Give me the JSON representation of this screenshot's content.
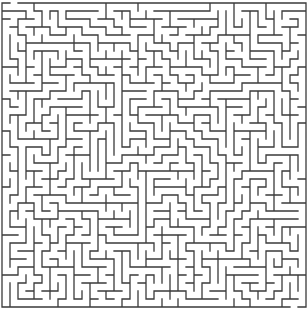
{
  "maze": {
    "width_px": 308,
    "height_px": 310,
    "cols": 38,
    "rows": 38,
    "cell_px": 8,
    "offset_x": 2,
    "offset_y": 3,
    "wall_color": "#3a3a3a",
    "background_color": "#ffffff",
    "wall_width": 1.3,
    "seed": 20240607,
    "entrance": {
      "side": "top",
      "col": 1
    },
    "exit": {
      "side": "bottom",
      "col": 36
    }
  }
}
